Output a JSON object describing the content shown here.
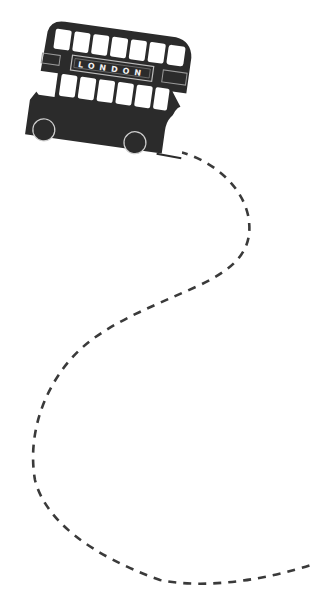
{
  "illustration": {
    "subject": "london-double-decker-bus-with-dashed-route",
    "bus": {
      "destination_sign": "LONDON",
      "body_color": "#2b2b2b",
      "window_color": "#ffffff",
      "upper_deck_windows": 7,
      "lower_deck_windows": 6,
      "wheels": 2
    },
    "route": {
      "style": "dashed",
      "color": "#3a3a3a"
    },
    "background_color": "#ffffff"
  }
}
